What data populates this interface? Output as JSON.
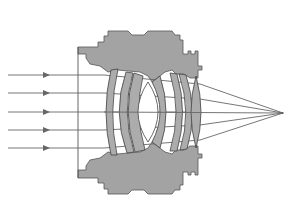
{
  "diagram": {
    "title": "",
    "colors": {
      "background": "#ffffff",
      "barrel": "#a3a3a3",
      "lens_element": "#acacac",
      "ray": "#666666",
      "outline": "#444444"
    },
    "incoming_rays": {
      "count": 5,
      "y_positions": [
        75,
        93,
        112,
        130,
        148
      ],
      "start_x": 8,
      "arrow_x": 46
    },
    "focal_point": {
      "x": 283,
      "y": 113
    },
    "optical_axis_y": 112,
    "lens_groups": {
      "front": [
        "meniscus-1",
        "meniscus-2",
        "meniscus-3"
      ],
      "center": [
        "biconvex-center"
      ],
      "rear": [
        "meniscus-4",
        "meniscus-5",
        "biconvex-rear"
      ]
    },
    "text_labels": []
  }
}
